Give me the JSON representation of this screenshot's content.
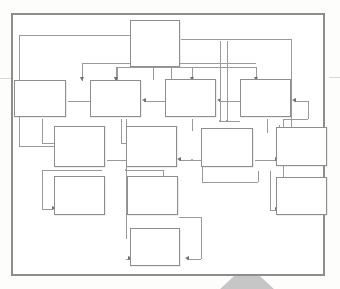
{
  "document": {
    "kind": "flowchart",
    "title": "",
    "notes": "Blank hierarchical flow diagram: empty boxes connected by arrows, printed inside a grey rectangular frame on white paper."
  },
  "frame": {
    "border_color": "#8d8d8d",
    "fill_color": "#ffffff",
    "x": 11,
    "y": 13,
    "width": 314,
    "height": 263
  },
  "page": {
    "background_color": "#fdfdfc",
    "watermark": {
      "shape": "triangle",
      "color": "#bcbcbc",
      "x": 219,
      "y": 264,
      "width": 56,
      "height": 26
    },
    "edge_marks": [
      {
        "x": 0,
        "y": 78,
        "width": 11,
        "height": 1,
        "color": "#d8d8d8"
      },
      {
        "x": 329,
        "y": 77,
        "width": 11,
        "height": 1,
        "color": "#d8d8d8"
      }
    ]
  },
  "style": {
    "node_border_color": "#8e8e8e",
    "node_fill_color": "#ffffff",
    "connector_color": "#9a9a9a",
    "arrowhead_color": "#6f6f6f"
  },
  "nodes": [
    {
      "id": "n1",
      "label": "",
      "x": 128,
      "y": 18,
      "width": 50,
      "height": 47,
      "row": 1,
      "col": 3
    },
    {
      "id": "n2",
      "label": "",
      "x": 14,
      "y": 80,
      "width": 52,
      "height": 37,
      "row": 2,
      "col": 1
    },
    {
      "id": "n3",
      "label": "",
      "x": 90,
      "y": 80,
      "width": 51,
      "height": 37,
      "row": 2,
      "col": 2
    },
    {
      "id": "n4",
      "label": "",
      "x": 165,
      "y": 79,
      "width": 51,
      "height": 38,
      "row": 2,
      "col": 3
    },
    {
      "id": "n5",
      "label": "",
      "x": 240,
      "y": 79,
      "width": 51,
      "height": 38,
      "row": 2,
      "col": 4
    },
    {
      "id": "n6",
      "label": "",
      "x": 54,
      "y": 126,
      "width": 51,
      "height": 41,
      "row": 3,
      "col": 1
    },
    {
      "id": "n7",
      "label": "",
      "x": 126,
      "y": 126,
      "width": 51,
      "height": 41,
      "row": 3,
      "col": 2
    },
    {
      "id": "n8",
      "label": "",
      "x": 201,
      "y": 128,
      "width": 52,
      "height": 39,
      "row": 3,
      "col": 3
    },
    {
      "id": "n9",
      "label": "",
      "x": 276,
      "y": 127,
      "width": 51,
      "height": 39,
      "row": 3,
      "col": 4
    },
    {
      "id": "n10",
      "label": "",
      "x": 54,
      "y": 176,
      "width": 51,
      "height": 39,
      "row": 4,
      "col": 1
    },
    {
      "id": "n11",
      "label": "",
      "x": 127,
      "y": 176,
      "width": 51,
      "height": 39,
      "row": 4,
      "col": 2
    },
    {
      "id": "n12",
      "label": "",
      "x": 276,
      "y": 177,
      "width": 51,
      "height": 38,
      "row": 4,
      "col": 4
    },
    {
      "id": "n13",
      "label": "",
      "x": 128,
      "y": 228,
      "width": 50,
      "height": 38,
      "row": 5,
      "col": 2
    }
  ],
  "connector_count": 22
}
